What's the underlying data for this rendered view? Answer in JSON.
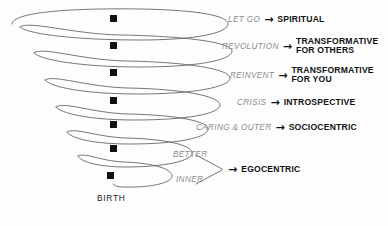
{
  "diagram": {
    "title_text": "",
    "origin_label": "BIRTH",
    "line_color": "#666666",
    "marker_color": "#111111",
    "trigger_color": "#8c8c8c",
    "outcome_color": "#111111",
    "background": "#fdfdfd",
    "arrow_glyph": "→",
    "stages": [
      {
        "trigger": "LET GO",
        "outcome_line1": "SPIRITUAL",
        "outcome_line2": "",
        "row_top": 14,
        "row_left": 228,
        "marker_x": 113,
        "marker_y": 18
      },
      {
        "trigger": "REVOLUTION",
        "outcome_line1": "TRANSFORMATIVE",
        "outcome_line2": "FOR OTHERS",
        "row_top": 38,
        "row_left": 222,
        "marker_x": 113,
        "marker_y": 45
      },
      {
        "trigger": "REINVENT",
        "outcome_line1": "TRANSFORMATIVE",
        "outcome_line2": "FOR YOU",
        "row_top": 67,
        "row_left": 230,
        "marker_x": 113,
        "marker_y": 72
      },
      {
        "trigger": "CRISIS",
        "outcome_line1": "INTROSPECTIVE",
        "outcome_line2": "",
        "row_top": 98,
        "row_left": 237,
        "marker_x": 113,
        "marker_y": 100
      },
      {
        "trigger": "CARING & OUTER",
        "outcome_line1": "SOCIOCENTRIC",
        "outcome_line2": "",
        "row_top": 123,
        "row_left": 212,
        "marker_x": 113,
        "marker_y": 124
      }
    ],
    "plain_labels": [
      {
        "text": "BETTER",
        "left": 173,
        "top": 153
      },
      {
        "text": "INNER",
        "left": 176,
        "top": 177
      }
    ],
    "egocentric": {
      "label": "EGOCENTRIC",
      "row_left": 239,
      "row_top": 166
    },
    "lower_markers": [
      {
        "x": 113,
        "y": 147
      },
      {
        "x": 110,
        "y": 175
      }
    ],
    "birth": {
      "left": 97,
      "top": 195
    }
  }
}
